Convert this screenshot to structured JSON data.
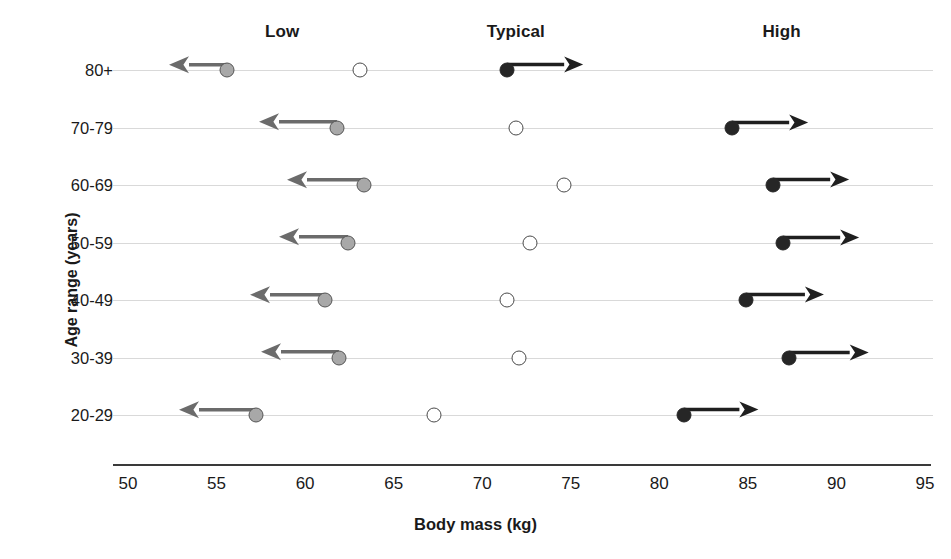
{
  "chart_data": {
    "type": "scatter",
    "title": "",
    "xlabel": "Body mass (kg)",
    "ylabel": "Age range (years)",
    "xlim": [
      50,
      95
    ],
    "xticks": [
      50,
      55,
      60,
      65,
      70,
      75,
      80,
      85,
      90,
      95
    ],
    "grid": "horizontal-row-guides",
    "legend_position": "top",
    "group_headers": [
      {
        "label": "Low",
        "x": 58.7
      },
      {
        "label": "Typical",
        "x": 71.9
      },
      {
        "label": "High",
        "x": 86.9
      }
    ],
    "categories": [
      "80+",
      "70-79",
      "60-69",
      "50-59",
      "40-49",
      "30-39",
      "20-29"
    ],
    "series": [
      {
        "name": "Low",
        "marker": "gray-filled-circle",
        "arrow": "left",
        "values": [
          55.6,
          61.8,
          63.3,
          62.4,
          61.1,
          61.9,
          57.2
        ],
        "arrow_tips": [
          52.3,
          57.4,
          59.0,
          58.5,
          56.9,
          57.5,
          52.9
        ]
      },
      {
        "name": "Typical",
        "marker": "open-circle",
        "arrow": "none",
        "values": [
          63.1,
          71.9,
          74.6,
          72.7,
          71.4,
          72.1,
          67.3
        ],
        "arrow_tips": [
          null,
          null,
          null,
          null,
          null,
          null,
          null
        ]
      },
      {
        "name": "High",
        "marker": "black-filled-circle",
        "arrow": "right",
        "values": [
          71.4,
          84.1,
          86.4,
          87.0,
          84.9,
          87.3,
          81.4
        ],
        "arrow_tips": [
          75.7,
          88.4,
          90.7,
          91.3,
          89.3,
          91.8,
          85.6
        ]
      }
    ],
    "colors": {
      "low_marker": "#a8a8a8",
      "low_marker_edge": "#555555",
      "typical_marker": "#ffffff",
      "typical_marker_edge": "#4a4a4a",
      "high_marker": "#262626",
      "low_arrow": "#6b6b6b",
      "high_arrow": "#1f1f1f",
      "row_guide": "#d9d9d9",
      "axis": "#3a3a3a",
      "text": "#1a1a1a"
    }
  }
}
